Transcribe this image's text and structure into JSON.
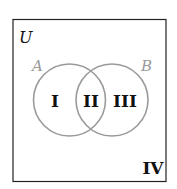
{
  "diagram": {
    "type": "venn",
    "universe_label": "U",
    "sets": [
      {
        "label": "A",
        "color": "#999999"
      },
      {
        "label": "B",
        "color": "#999999"
      }
    ],
    "regions": [
      {
        "id": "I",
        "label": "I",
        "description": "A only"
      },
      {
        "id": "II",
        "label": "II",
        "description": "A and B"
      },
      {
        "id": "III",
        "label": "III",
        "description": "B only"
      },
      {
        "id": "IV",
        "label": "IV",
        "description": "outside A and B"
      }
    ],
    "colors": {
      "box": "#222222",
      "circle": "#999999",
      "set_label": "#999999",
      "region_label": "#111111"
    }
  }
}
